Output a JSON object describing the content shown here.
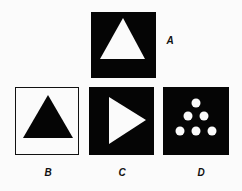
{
  "figure": {
    "colors": {
      "dark": "#050505",
      "light": "#fbfbfb"
    },
    "panels": [
      {
        "id": "A",
        "label": "A",
        "description": "white upward triangle on black square"
      },
      {
        "id": "B",
        "label": "B",
        "description": "black upward triangle on white square with black border"
      },
      {
        "id": "C",
        "label": "C",
        "description": "white right-pointing triangle on black square"
      },
      {
        "id": "D",
        "label": "D",
        "description": "six white dots arranged in a triangle on black square"
      }
    ]
  }
}
